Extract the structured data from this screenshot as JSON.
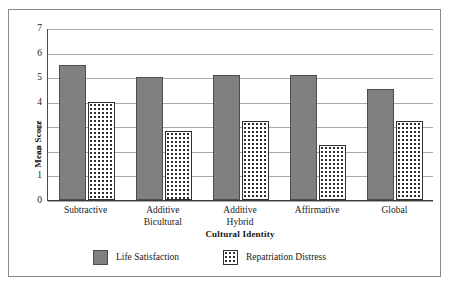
{
  "chart_data": {
    "type": "bar",
    "title": "",
    "xlabel": "Cultural Identity",
    "ylabel": "Mean Score",
    "categories": [
      "Subtractive",
      "Additive Bicultural",
      "Additive Hybrid",
      "Affirmative",
      "Global"
    ],
    "category_lines": [
      [
        "Subtractive"
      ],
      [
        "Additive",
        "Bicultural"
      ],
      [
        "Additive",
        "Hybrid"
      ],
      [
        "Affirmative"
      ],
      [
        "Global"
      ]
    ],
    "series": [
      {
        "name": "Life Satisfaction",
        "fill": "solid-gray",
        "color": "#808080",
        "values": [
          5.5,
          5.0,
          5.1,
          5.1,
          4.5
        ]
      },
      {
        "name": "Repatriation Distress",
        "fill": "dotted-white",
        "color": "#ffffff",
        "values": [
          4.0,
          2.8,
          3.2,
          2.25,
          3.2
        ]
      }
    ],
    "ylim": [
      0,
      7
    ],
    "yticks": [
      0,
      1,
      2,
      3,
      4,
      5,
      6,
      7
    ],
    "ytick_labels": [
      "0",
      "1",
      "2",
      "3",
      "4",
      "5",
      "6",
      "7"
    ],
    "grid": true,
    "grid_axis": "y",
    "legend_position": "bottom",
    "legend_entries": [
      "Life Satisfaction",
      "Repatriation Distress"
    ]
  },
  "colors": {
    "series_solid": "#808080",
    "series_dotted": "#ffffff",
    "gridline": "#a9a9a9",
    "axis": "#3a3a3a",
    "frame": "#8a8a8a",
    "text": "#1a1a1a",
    "background": "#ffffff"
  }
}
